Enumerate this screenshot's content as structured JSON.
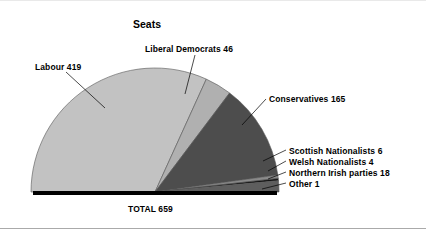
{
  "chart_data": {
    "type": "pie",
    "variant": "semicircle",
    "title": "Seats",
    "total_label": "TOTAL 659",
    "total": 659,
    "xlabel": "",
    "ylabel": "",
    "grid": false,
    "legend_position": "none",
    "labels_style": "leader-line callouts",
    "categories": [
      "Labour",
      "Liberal Democrats",
      "Conservatives",
      "Scottish Nationalists",
      "Welsh Nationalists",
      "Northern Irish parties",
      "Other"
    ],
    "values": [
      419,
      46,
      165,
      6,
      4,
      18,
      1
    ],
    "slices": [
      {
        "name": "Labour",
        "value": 419,
        "label": "Labour 419",
        "color": "#c2c2c2",
        "start_deg": 180.0,
        "end_deg": 65.55
      },
      {
        "name": "Liberal Democrats",
        "value": 46,
        "label": "Liberal Democrats 46",
        "color": "#b0b0b0",
        "start_deg": 65.55,
        "end_deg": 52.99
      },
      {
        "name": "Conservatives",
        "value": 165,
        "label": "Conservatives 165",
        "color": "#4d4d4d",
        "start_deg": 52.99,
        "end_deg": 7.92
      },
      {
        "name": "Scottish Nationalists",
        "value": 6,
        "label": "Scottish Nationalists 6",
        "color": "#8a8a8a",
        "start_deg": 7.92,
        "end_deg": 6.28
      },
      {
        "name": "Welsh Nationalists",
        "value": 4,
        "label": "Welsh Nationalists 4",
        "color": "#141414",
        "start_deg": 6.28,
        "end_deg": 5.19
      },
      {
        "name": "Northern Irish parties",
        "value": 18,
        "label": "Northern Irish parties 18",
        "color": "#5e5e5e",
        "start_deg": 5.19,
        "end_deg": 0.27
      },
      {
        "name": "Other",
        "value": 1,
        "label": "Other 1",
        "color": "#000000",
        "start_deg": 0.27,
        "end_deg": 0.0
      }
    ]
  },
  "title": "Seats",
  "labels": {
    "labour": "Labour 419",
    "liberal_democrats": "Liberal Democrats 46",
    "conservatives": "Conservatives 165",
    "scottish_nationalists": "Scottish Nationalists 6",
    "welsh_nationalists": "Welsh Nationalists 4",
    "northern_irish": "Northern Irish parties 18",
    "other": "Other 1",
    "total": "TOTAL 659"
  },
  "geometry": {
    "center_x": 155,
    "center_y": 192,
    "radius": 124,
    "baseline_thickness": 4
  },
  "colors": {
    "background": "#ffffff",
    "text": "#000000",
    "outline": "#555555",
    "baseline": "#000000",
    "rule": "#aaaaaa"
  }
}
